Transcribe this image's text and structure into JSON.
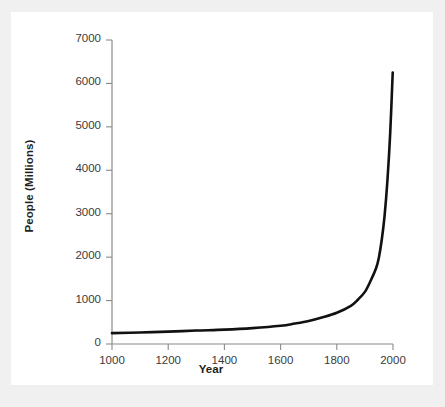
{
  "figure": {
    "background_color": "#ffffff",
    "page_background_color": "#f0f0f0",
    "line_color": "#111111",
    "axis_color": "#8a8a8a",
    "tick_label_color": "#3a3a3a",
    "axis_label_color": "#231f20"
  },
  "chart_data": {
    "type": "line",
    "title": "",
    "xlabel": "Year",
    "ylabel": "People (Millions)",
    "xlim": [
      1000,
      2000
    ],
    "ylim": [
      0,
      7000
    ],
    "xticks": [
      1000,
      1200,
      1400,
      1600,
      1800,
      2000
    ],
    "xtick_labels": [
      "1000",
      "1200",
      "1400",
      "1600",
      "1800",
      "2000"
    ],
    "yticks": [
      0,
      1000,
      2000,
      3000,
      4000,
      5000,
      6000,
      7000
    ],
    "ytick_labels": [
      "0",
      "1000",
      "2000",
      "3000",
      "4000",
      "5000",
      "6000",
      "7000"
    ],
    "grid": false,
    "legend": false,
    "legend_position": "none",
    "series": [
      {
        "name": "World population",
        "x": [
          1000,
          1100,
          1200,
          1300,
          1400,
          1500,
          1600,
          1650,
          1700,
          1750,
          1800,
          1850,
          1875,
          1900,
          1920,
          1940,
          1950,
          1960,
          1970,
          1980,
          1990,
          1999
        ],
        "values": [
          250,
          265,
          285,
          310,
          330,
          365,
          420,
          470,
          530,
          615,
          720,
          880,
          1020,
          1200,
          1450,
          1750,
          2000,
          2400,
          2950,
          3750,
          4850,
          6250
        ]
      }
    ],
    "annotations": []
  }
}
